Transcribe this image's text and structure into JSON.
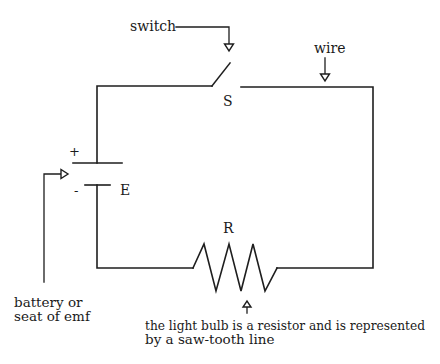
{
  "diagram": {
    "type": "circuit",
    "labels": {
      "switch_callout": "switch",
      "wire_callout": "wire",
      "switch_symbol": "S",
      "battery_symbol": "E",
      "resistor_symbol": "R",
      "battery_plus": "+",
      "battery_minus": "-",
      "battery_callout_line1": "battery or",
      "battery_callout_line2": "seat of emf",
      "resistor_callout_line1": "the light bulb is a resistor and is represented",
      "resistor_callout_line2": "by a saw-tooth line"
    },
    "components": [
      {
        "id": "S",
        "kind": "switch",
        "state": "open"
      },
      {
        "id": "E",
        "kind": "battery"
      },
      {
        "id": "R",
        "kind": "resistor",
        "represents": "light bulb"
      }
    ]
  }
}
